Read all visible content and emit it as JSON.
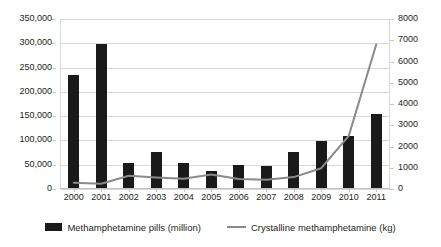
{
  "chart_data": {
    "type": "bar",
    "title": "",
    "subtitle": "",
    "xlabel": "",
    "categories": [
      "2000",
      "2001",
      "2002",
      "2003",
      "2004",
      "2005",
      "2006",
      "2007",
      "2008",
      "2009",
      "2010",
      "2011"
    ],
    "grid": true,
    "legend_position": "bottom",
    "axes": {
      "left": {
        "label": "",
        "ylim": [
          0,
          350000
        ],
        "step": 50000,
        "ticks": [
          "0",
          "50,000",
          "100,000",
          "150,000",
          "200,000",
          "250,000",
          "300,000",
          "350,000"
        ],
        "tick_values": [
          0,
          50000,
          100000,
          150000,
          200000,
          250000,
          300000,
          350000
        ]
      },
      "right": {
        "label": "",
        "ylim": [
          0,
          8000
        ],
        "step": 1000,
        "ticks": [
          "0",
          "1000",
          "2000",
          "3000",
          "4000",
          "5000",
          "6000",
          "7000",
          "8000"
        ],
        "tick_values": [
          0,
          1000,
          2000,
          3000,
          4000,
          5000,
          6000,
          7000,
          8000
        ]
      }
    },
    "series": [
      {
        "name": "Methamphetamine pills (million)",
        "type": "bar",
        "axis": "left",
        "color": "#1a1a1a",
        "values": [
          235000,
          299000,
          54000,
          77000,
          54000,
          38000,
          50000,
          47000,
          77000,
          98000,
          110000,
          155000
        ]
      },
      {
        "name": "Crystalline methamphetamine (kg)",
        "type": "line",
        "axis": "right",
        "color": "#8a8a8a",
        "values": [
          300,
          250,
          620,
          540,
          480,
          680,
          470,
          430,
          560,
          980,
          2500,
          6800
        ]
      }
    ]
  },
  "legend": {
    "items": [
      {
        "label": "Methamphetamine pills (million)",
        "marker": "bar-swatch",
        "color": "#1a1a1a"
      },
      {
        "label": "Crystalline methamphetamine (kg)",
        "marker": "line-swatch",
        "color": "#8a8a8a"
      }
    ]
  },
  "colors": {
    "bar": "#1a1a1a",
    "line": "#8a8a8a",
    "grid": "#d9d9d9",
    "text": "#231f20",
    "background": "#ffffff"
  }
}
